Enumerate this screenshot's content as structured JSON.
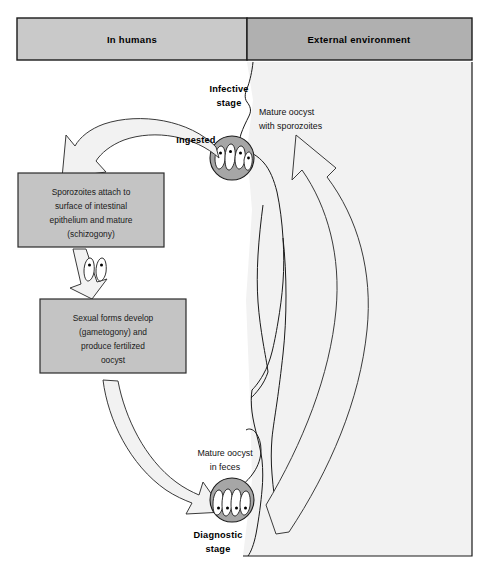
{
  "figure": {
    "colors": {
      "header_left_fill": "#c9c9c9",
      "header_right_fill": "#b0b0b0",
      "box_fill": "#c4c4c4",
      "external_panel_fill": "#f2f2f2",
      "oocyst_fill": "#a6a6a6",
      "arrow_fill": "#f2f2f2",
      "outline": "#1a1a1a"
    }
  },
  "headers": {
    "left": "In humans",
    "right": "External environment"
  },
  "labels": {
    "infective_stage_line1": "Infective",
    "infective_stage_line2": "stage",
    "ingested": "Ingested",
    "mature_oocyst_sporozoites_line1": "Mature oocyst",
    "mature_oocyst_sporozoites_line2": "with sporozoites",
    "mature_oocyst_feces_line1": "Mature oocyst",
    "mature_oocyst_feces_line2": "in feces",
    "diagnostic_stage_line1": "Diagnostic",
    "diagnostic_stage_line2": "stage"
  },
  "boxes": [
    {
      "id": "schizogony-box",
      "lines": [
        "Sporozoites attach to",
        "surface of intestinal",
        "epithelium and mature",
        "(schizogony)"
      ]
    },
    {
      "id": "gametogony-box",
      "lines": [
        "Sexual forms develop",
        "(gametogony) and",
        "produce fertilized",
        "oocyst"
      ]
    }
  ],
  "oocysts": [
    {
      "id": "ingested-oocyst",
      "sporozoite_count": 4
    },
    {
      "id": "feces-oocyst",
      "sporozoite_count": 4
    }
  ],
  "arrows": [
    {
      "id": "ingestion-arrow",
      "from": "ingested-oocyst",
      "to": "schizogony-box"
    },
    {
      "id": "schizogony-to-gametogony-arrow",
      "from": "schizogony-box",
      "to": "gametogony-box"
    },
    {
      "id": "excretion-arrow",
      "from": "gametogony-box",
      "to": "feces-oocyst"
    },
    {
      "id": "environment-return-arrow",
      "from": "feces-oocyst",
      "to": "ingested-oocyst"
    }
  ]
}
